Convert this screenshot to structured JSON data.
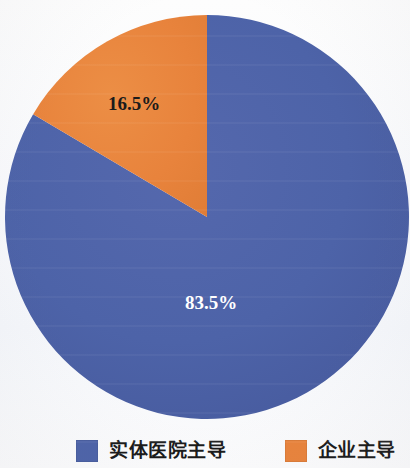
{
  "chart_data": {
    "type": "pie",
    "title": "",
    "subtitle": "",
    "xlabel": "",
    "ylabel": "",
    "grid": false,
    "legend_position": "bottom",
    "start_angle_deg": 90,
    "direction": "counterclockwise",
    "center": {
      "x": 207,
      "y": 217
    },
    "radius": 202,
    "categories": [
      "实体医院主导",
      "企业主导"
    ],
    "values": [
      83.5,
      16.5
    ],
    "labels": [
      "83.5%",
      "16.5%"
    ],
    "colors": [
      "#4d63a8",
      "#e8833c"
    ],
    "slices": [
      {
        "name": "实体医院主导",
        "value": 83.5,
        "label": "83.5%",
        "color": "#4d63a8",
        "label_color": "#ffffff",
        "label_x": 211,
        "label_y": 305
      },
      {
        "name": "企业主导",
        "value": 16.5,
        "label": "16.5%",
        "color": "#e8833c",
        "label_color": "#1b1b1b",
        "label_x": 134,
        "label_y": 106
      }
    ]
  },
  "legend": {
    "items": [
      {
        "label": "实体医院主导",
        "color": "#4d63a8",
        "swatch_name": "legend-swatch-blue"
      },
      {
        "label": "企业主导",
        "color": "#e8833c",
        "swatch_name": "legend-swatch-orange"
      }
    ]
  },
  "colors": {
    "blue": "#4d63a8",
    "orange": "#e8833c",
    "background": "#f7f8fb",
    "label_dark": "#1b1b1b",
    "label_light": "#ffffff"
  }
}
